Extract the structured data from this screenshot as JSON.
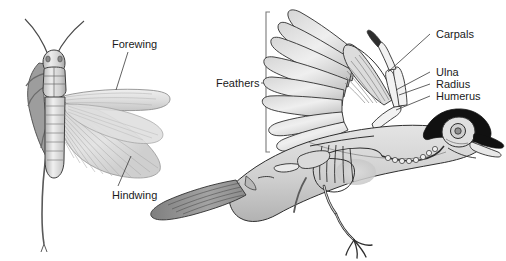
{
  "figure": {
    "background_color": "#ffffff",
    "width": 506,
    "height": 261
  },
  "panels": [
    {
      "name": "grasshopper-panel",
      "subject": "grasshopper",
      "labels": [
        {
          "text": "Forewing",
          "x": 112,
          "y": 44
        },
        {
          "text": "Hindwing",
          "x": 112,
          "y": 196
        }
      ]
    },
    {
      "name": "bird-panel",
      "subject": "bird-wing-skeleton",
      "labels": [
        {
          "text": "Feathers",
          "x": 216,
          "y": 83
        },
        {
          "text": "Carpals",
          "x": 438,
          "y": 38
        },
        {
          "text": "Ulna",
          "x": 438,
          "y": 76
        },
        {
          "text": "Radius",
          "x": 438,
          "y": 88
        },
        {
          "text": "Humerus",
          "x": 438,
          "y": 100
        }
      ]
    }
  ],
  "palette": {
    "outline": "#2b2b2b",
    "leader_line": "#3a3a3a",
    "bracket": "#7a7a7a",
    "text": "#1a1a1a",
    "body_light": "#e9e9e9",
    "body_mid": "#c9c9c9",
    "body_dark": "#9a9a9a",
    "wing_translucent": "#dcdcdc",
    "tail_dark": "#8e8e8e",
    "crest_black": "#111111",
    "bone_fill": "#f2f2f2"
  }
}
